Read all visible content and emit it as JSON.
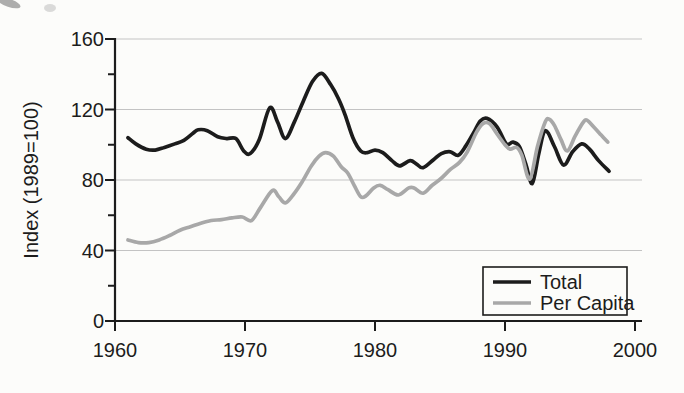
{
  "chart_data": {
    "type": "line",
    "title": "",
    "xlabel": "",
    "ylabel": "Index (1989=100)",
    "x_range": [
      1960,
      2000
    ],
    "y_range": [
      0,
      160
    ],
    "x_ticks": [
      1960,
      1970,
      1980,
      1990,
      2000
    ],
    "y_ticks": [
      0,
      40,
      80,
      120,
      160
    ],
    "y_minor_ticks": [
      20,
      60,
      100,
      140
    ],
    "grid": "horizontal",
    "gridlines_at": [
      40,
      80,
      120,
      160
    ],
    "gridline_color": "#c3c3c3",
    "axis_color": "#1c1c1c",
    "background": "#fcfcfa",
    "legend_position": "bottom-right",
    "series": [
      {
        "name": "Total",
        "color": "#1c1c1c",
        "points": [
          [
            1961.0,
            104
          ],
          [
            1961.6,
            100.5
          ],
          [
            1962.4,
            97.5
          ],
          [
            1963.1,
            97
          ],
          [
            1963.8,
            98.5
          ],
          [
            1964.6,
            100.5
          ],
          [
            1965.3,
            102.5
          ],
          [
            1966.0,
            106.5
          ],
          [
            1966.4,
            108.5
          ],
          [
            1967.1,
            108
          ],
          [
            1967.9,
            104.5
          ],
          [
            1968.6,
            103.5
          ],
          [
            1969.3,
            103.5
          ],
          [
            1969.9,
            96.5
          ],
          [
            1970.4,
            95
          ],
          [
            1971.1,
            103
          ],
          [
            1971.9,
            121
          ],
          [
            1972.5,
            113
          ],
          [
            1973.1,
            103.5
          ],
          [
            1973.8,
            113
          ],
          [
            1974.5,
            125
          ],
          [
            1975.2,
            136
          ],
          [
            1975.9,
            140.5
          ],
          [
            1976.6,
            134
          ],
          [
            1977.2,
            126
          ],
          [
            1977.7,
            117
          ],
          [
            1978.3,
            104
          ],
          [
            1978.9,
            96.5
          ],
          [
            1979.4,
            95.5
          ],
          [
            1980.0,
            97
          ],
          [
            1980.6,
            95.5
          ],
          [
            1981.3,
            91
          ],
          [
            1981.9,
            88
          ],
          [
            1982.7,
            91
          ],
          [
            1983.2,
            89
          ],
          [
            1983.7,
            87
          ],
          [
            1984.5,
            91.5
          ],
          [
            1985.1,
            95
          ],
          [
            1985.8,
            96
          ],
          [
            1986.4,
            94
          ],
          [
            1987.0,
            99.5
          ],
          [
            1987.6,
            107
          ],
          [
            1988.1,
            113.5
          ],
          [
            1988.6,
            115
          ],
          [
            1989.4,
            110
          ],
          [
            1990.1,
            100.5
          ],
          [
            1990.6,
            101.5
          ],
          [
            1991.1,
            99
          ],
          [
            1991.6,
            89
          ],
          [
            1992.1,
            78
          ],
          [
            1992.6,
            95
          ],
          [
            1993.1,
            108
          ],
          [
            1993.8,
            99
          ],
          [
            1994.5,
            88.5
          ],
          [
            1995.2,
            96
          ],
          [
            1995.9,
            100.5
          ],
          [
            1996.5,
            97.5
          ],
          [
            1997.2,
            91
          ],
          [
            1998.0,
            85
          ]
        ]
      },
      {
        "name": "Per Capita",
        "color": "#a8a8a8",
        "points": [
          [
            1961.0,
            46
          ],
          [
            1961.8,
            44.5
          ],
          [
            1962.6,
            44.5
          ],
          [
            1963.4,
            46
          ],
          [
            1964.2,
            48.5
          ],
          [
            1965.0,
            51.5
          ],
          [
            1965.8,
            53.5
          ],
          [
            1966.6,
            55.5
          ],
          [
            1967.4,
            57
          ],
          [
            1968.2,
            57.5
          ],
          [
            1969.0,
            58.5
          ],
          [
            1969.8,
            59
          ],
          [
            1970.5,
            57
          ],
          [
            1971.2,
            64.5
          ],
          [
            1972.1,
            74
          ],
          [
            1972.6,
            70.5
          ],
          [
            1973.1,
            67
          ],
          [
            1973.7,
            71.5
          ],
          [
            1974.4,
            79
          ],
          [
            1975.1,
            88
          ],
          [
            1975.7,
            93.5
          ],
          [
            1976.2,
            95.5
          ],
          [
            1976.8,
            93.5
          ],
          [
            1977.4,
            87.5
          ],
          [
            1977.9,
            84
          ],
          [
            1978.4,
            77
          ],
          [
            1978.9,
            70.5
          ],
          [
            1979.3,
            71
          ],
          [
            1979.9,
            75.5
          ],
          [
            1980.4,
            77
          ],
          [
            1981.0,
            74.5
          ],
          [
            1981.8,
            71.5
          ],
          [
            1982.6,
            75.5
          ],
          [
            1983.0,
            75.5
          ],
          [
            1983.7,
            72.5
          ],
          [
            1984.4,
            77
          ],
          [
            1985.1,
            81
          ],
          [
            1985.8,
            86
          ],
          [
            1986.5,
            90
          ],
          [
            1987.1,
            96
          ],
          [
            1987.8,
            107
          ],
          [
            1988.3,
            112
          ],
          [
            1988.8,
            112
          ],
          [
            1989.4,
            106
          ],
          [
            1990.0,
            100
          ],
          [
            1990.4,
            97.5
          ],
          [
            1990.9,
            98.5
          ],
          [
            1991.3,
            94
          ],
          [
            1991.9,
            80.5
          ],
          [
            1992.5,
            99
          ],
          [
            1993.1,
            113
          ],
          [
            1993.4,
            114.5
          ],
          [
            1993.8,
            111
          ],
          [
            1994.3,
            103
          ],
          [
            1994.8,
            96.5
          ],
          [
            1995.4,
            105
          ],
          [
            1996.0,
            112.5
          ],
          [
            1996.3,
            114
          ],
          [
            1996.9,
            109.5
          ],
          [
            1997.4,
            105.5
          ],
          [
            1997.9,
            101.5
          ]
        ]
      }
    ]
  }
}
